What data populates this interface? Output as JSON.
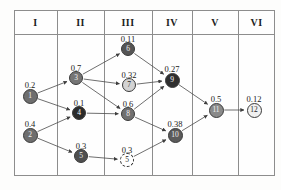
{
  "figure": {
    "type": "layered-dag-table",
    "columns": [
      {
        "label": "I",
        "x": 14,
        "w": 43
      },
      {
        "label": "II",
        "x": 57,
        "w": 47
      },
      {
        "label": "III",
        "x": 104,
        "w": 48
      },
      {
        "label": "IV",
        "x": 152,
        "w": 40
      },
      {
        "label": "V",
        "x": 192,
        "w": 46
      },
      {
        "label": "VI",
        "x": 238,
        "w": 37
      }
    ],
    "nodes": [
      {
        "id": "1",
        "label": "1",
        "value": "0.2",
        "col": "I",
        "cx": 30,
        "cy": 96,
        "r": 7.5,
        "fill": "#6e6e6e",
        "text": "#f2f2f2",
        "style": "solid",
        "label_dx": 0,
        "label_dy": -16
      },
      {
        "id": "2",
        "label": "2",
        "value": "0.4",
        "col": "I",
        "cx": 30,
        "cy": 135,
        "r": 7.5,
        "fill": "#6e6e6e",
        "text": "#f2f2f2",
        "style": "solid",
        "label_dx": 0,
        "label_dy": -16
      },
      {
        "id": "3",
        "label": "3",
        "value": "0.7",
        "col": "II",
        "cx": 76,
        "cy": 78,
        "r": 7,
        "fill": "#757575",
        "text": "#f2f2f2",
        "style": "solid",
        "label_dx": 0,
        "label_dy": -15
      },
      {
        "id": "4",
        "label": "4",
        "value": "0.1",
        "col": "II",
        "cx": 79,
        "cy": 113,
        "r": 7,
        "fill": "#2b2b2b",
        "text": "#ffffff",
        "style": "solid",
        "label_dx": 0,
        "label_dy": -15
      },
      {
        "id": "5",
        "label": "5",
        "value": "0.3",
        "col": "II",
        "cx": 81,
        "cy": 156,
        "r": 7,
        "fill": "#4f4f4f",
        "text": "#f0f0f0",
        "style": "solid",
        "label_dx": 0,
        "label_dy": -15
      },
      {
        "id": "6",
        "label": "6",
        "value": "0.11",
        "col": "III",
        "cx": 128,
        "cy": 49,
        "r": 7,
        "fill": "#555555",
        "text": "#f2f2f2",
        "style": "solid",
        "label_dx": 0,
        "label_dy": -15
      },
      {
        "id": "7",
        "label": "7",
        "value": "0.32",
        "col": "III",
        "cx": 129,
        "cy": 85,
        "r": 7,
        "fill": "#d3d3d3",
        "text": "#2a2a2a",
        "style": "solid",
        "label_dx": 0,
        "label_dy": -15
      },
      {
        "id": "8",
        "label": "8",
        "value": "0.6",
        "col": "III",
        "cx": 128,
        "cy": 114,
        "r": 7,
        "fill": "#707070",
        "text": "#f2f2f2",
        "style": "solid",
        "label_dx": 0,
        "label_dy": -15
      },
      {
        "id": "5p",
        "label": "5",
        "value": "0.3",
        "col": "III",
        "cx": 127,
        "cy": 160,
        "r": 7,
        "fill": "#ffffff",
        "text": "#1b1b1b",
        "style": "dashed",
        "label_dx": 0,
        "label_dy": -15
      },
      {
        "id": "9",
        "label": "9",
        "value": "0.27",
        "col": "IV",
        "cx": 172,
        "cy": 80,
        "r": 7.5,
        "fill": "#2e2e2e",
        "text": "#ffffff",
        "style": "solid",
        "label_dx": 0,
        "label_dy": -16
      },
      {
        "id": "10",
        "label": "10",
        "value": "0.38",
        "col": "IV",
        "cx": 175,
        "cy": 135,
        "r": 7.5,
        "fill": "#5b5b5b",
        "text": "#f2f2f2",
        "style": "solid",
        "label_dx": 0,
        "label_dy": -16
      },
      {
        "id": "11",
        "label": "11",
        "value": "0.5",
        "col": "V",
        "cx": 216,
        "cy": 110,
        "r": 7.5,
        "fill": "#8a8a8a",
        "text": "#f5f5f5",
        "style": "solid",
        "label_dx": 0,
        "label_dy": -16
      },
      {
        "id": "12",
        "label": "12",
        "value": "0.12",
        "col": "VI",
        "cx": 254,
        "cy": 110,
        "r": 7.5,
        "fill": "#f0f0f0",
        "text": "#1f1f1f",
        "style": "solid",
        "label_dx": 0,
        "label_dy": -16
      }
    ],
    "edges": [
      {
        "from": "1",
        "to": "3"
      },
      {
        "from": "1",
        "to": "4"
      },
      {
        "from": "2",
        "to": "4"
      },
      {
        "from": "2",
        "to": "5"
      },
      {
        "from": "3",
        "to": "6"
      },
      {
        "from": "3",
        "to": "7"
      },
      {
        "from": "3",
        "to": "8"
      },
      {
        "from": "4",
        "to": "8"
      },
      {
        "from": "5",
        "to": "5p"
      },
      {
        "from": "6",
        "to": "9"
      },
      {
        "from": "7",
        "to": "9"
      },
      {
        "from": "8",
        "to": "9"
      },
      {
        "from": "8",
        "to": "10"
      },
      {
        "from": "5p",
        "to": "10"
      },
      {
        "from": "9",
        "to": "11"
      },
      {
        "from": "10",
        "to": "11"
      },
      {
        "from": "11",
        "to": "12"
      }
    ],
    "frame": {
      "x": 14,
      "y": 10,
      "w": 261,
      "h": 166,
      "header_height": 24
    },
    "colors": {
      "border": "#8d8d8d",
      "edge": "#4a4a4a",
      "background": "#fefefe",
      "text": "#1a1a1a"
    }
  }
}
